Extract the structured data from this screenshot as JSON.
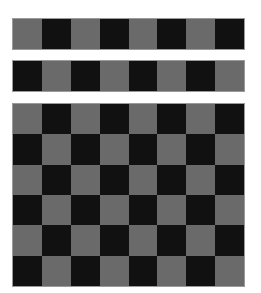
{
  "colors": {
    "light": "#6a6a6a",
    "dark": "#111111",
    "background": "#ffffff"
  },
  "strips": [
    {
      "name": "strip-1",
      "pattern": [
        "g",
        "b",
        "g",
        "b",
        "g",
        "b",
        "g",
        "b"
      ]
    },
    {
      "name": "strip-2",
      "pattern": [
        "b",
        "g",
        "b",
        "g",
        "b",
        "g",
        "b",
        "g"
      ]
    }
  ],
  "board": {
    "columns": 8,
    "rows": 6,
    "first_cell": "g"
  }
}
